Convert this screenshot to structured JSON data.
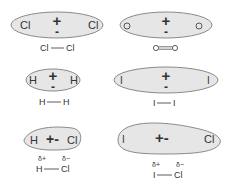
{
  "colors": {
    "fill": "#e6e6e6",
    "stroke": "#8a8a8a",
    "text": "#333333"
  },
  "molecules": [
    {
      "id": "cl2",
      "left_atom": "Cl",
      "right_atom": "Cl",
      "center_top": "+",
      "center_bottom": "-",
      "formula_left": "Cl",
      "formula_right": "Cl",
      "bond": "single"
    },
    {
      "id": "o2",
      "left_atom": "O",
      "right_atom": "O",
      "center_top": "+",
      "center_bottom": "-",
      "formula_left": "O",
      "formula_right": "O",
      "bond": "double"
    },
    {
      "id": "h2",
      "left_atom": "H",
      "right_atom": "H",
      "center_top": "+",
      "center_bottom": "-",
      "formula_left": "H",
      "formula_right": "H",
      "bond": "single"
    },
    {
      "id": "i2",
      "left_atom": "I",
      "right_atom": "I",
      "center_top": "+",
      "center_bottom": "-",
      "formula_left": "I",
      "formula_right": "I",
      "bond": "single"
    },
    {
      "id": "hcl",
      "left_atom": "H",
      "right_atom": "Cl",
      "center": "+-",
      "delta_left": "δ+",
      "delta_right": "δ−",
      "formula_left": "H",
      "formula_right": "Cl",
      "bond": "single"
    },
    {
      "id": "icl",
      "left_atom": "I",
      "right_atom": "Cl",
      "center": "+-",
      "delta_left": "δ+",
      "delta_right": "δ−",
      "formula_left": "I",
      "formula_right": "Cl",
      "bond": "single"
    }
  ]
}
